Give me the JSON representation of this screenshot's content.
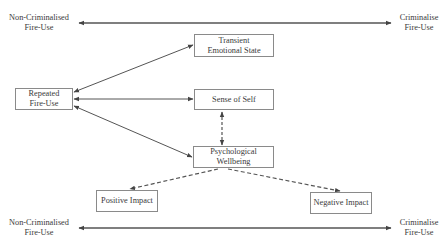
{
  "diagram": {
    "spectrum_top": {
      "left_label": "Non-Criminalised\nFire-Use",
      "right_label": "Criminalise\nFire-Use"
    },
    "spectrum_bottom": {
      "left_label": "Non-Criminalised\nFire-Use",
      "right_label": "Criminalise\nFire-Use"
    },
    "nodes": {
      "repeated_fire_use": "Repeated\nFire-Use",
      "transient_emotional_state": "Transient\nEmotional State",
      "sense_of_self": "Sense of Self",
      "psychological_wellbeing": "Psychological\nWellbeing",
      "positive_impact": "Positive Impact",
      "negative_impact": "Negative Impact"
    },
    "edges": [
      {
        "from": "repeated_fire_use",
        "to": "transient_emotional_state",
        "style": "solid",
        "direction": "both"
      },
      {
        "from": "repeated_fire_use",
        "to": "sense_of_self",
        "style": "solid",
        "direction": "both"
      },
      {
        "from": "repeated_fire_use",
        "to": "psychological_wellbeing",
        "style": "solid",
        "direction": "both"
      },
      {
        "from": "psychological_wellbeing",
        "to": "sense_of_self",
        "style": "dashed",
        "direction": "both"
      },
      {
        "from": "psychological_wellbeing",
        "to": "positive_impact",
        "style": "dashed",
        "direction": "forward"
      },
      {
        "from": "psychological_wellbeing",
        "to": "negative_impact",
        "style": "dashed",
        "direction": "forward"
      },
      {
        "from": "spectrum_left",
        "to": "spectrum_right",
        "style": "solid",
        "direction": "both"
      }
    ],
    "colors": {
      "line": "#555555",
      "box_border": "#8a8a8a",
      "text": "#3a3a3a",
      "background": "#ffffff"
    }
  }
}
